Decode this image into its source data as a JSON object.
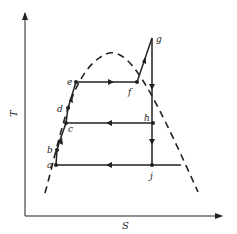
{
  "diagram": {
    "type": "T-s diagram (vapor power cycle with saturation dome)",
    "axes": {
      "x_label": "S",
      "y_label": "T"
    },
    "points": [
      {
        "id": "a",
        "label": "a"
      },
      {
        "id": "b",
        "label": "b"
      },
      {
        "id": "c",
        "label": "c"
      },
      {
        "id": "d",
        "label": "d"
      },
      {
        "id": "e",
        "label": "e"
      },
      {
        "id": "f",
        "label": "f"
      },
      {
        "id": "g",
        "label": "g"
      },
      {
        "id": "h",
        "label": "h"
      },
      {
        "id": "j",
        "label": "j"
      }
    ],
    "processes": [
      {
        "from": "a",
        "to": "b",
        "direction": "up"
      },
      {
        "from": "b",
        "to": "c",
        "direction": "up"
      },
      {
        "from": "c",
        "to": "d",
        "direction": "up"
      },
      {
        "from": "d",
        "to": "e",
        "direction": "up"
      },
      {
        "from": "e",
        "to": "f",
        "direction": "right"
      },
      {
        "from": "f",
        "to": "g",
        "direction": "up-right"
      },
      {
        "from": "g",
        "to": "h",
        "direction": "down"
      },
      {
        "from": "h",
        "to": "j",
        "direction": "down"
      },
      {
        "from": "h",
        "to": "c",
        "direction": "left"
      },
      {
        "from": "j",
        "to": "a",
        "direction": "left"
      }
    ],
    "saturation_dome": "dashed"
  }
}
